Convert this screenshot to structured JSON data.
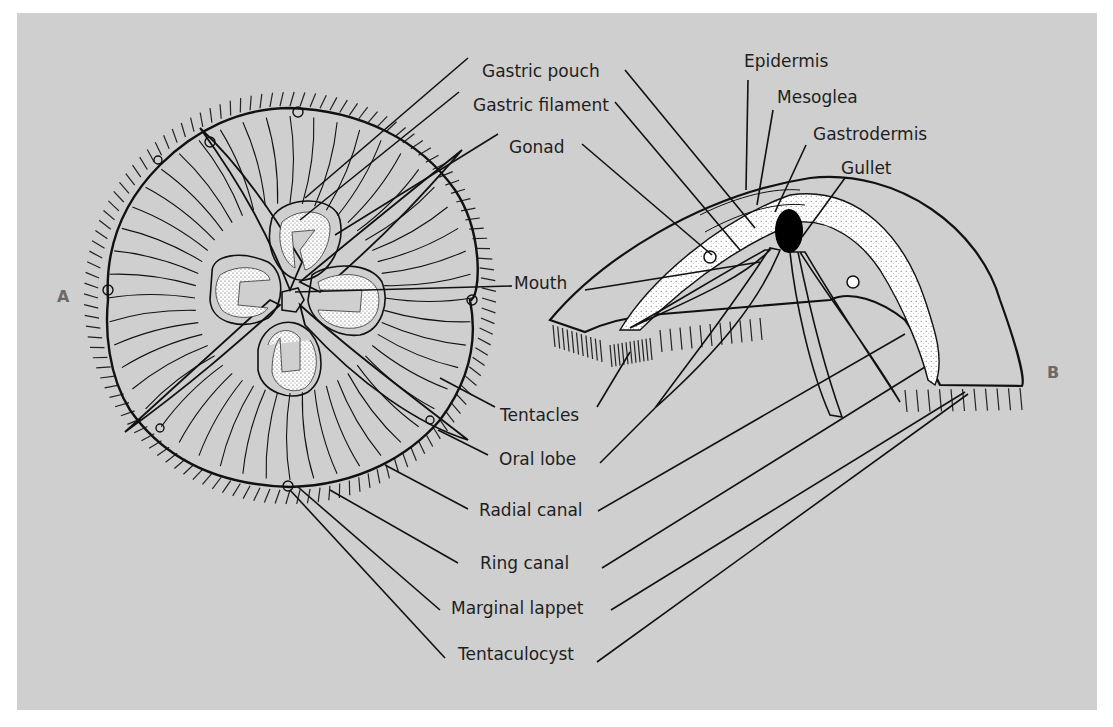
{
  "figure": {
    "panel_color": "#cfcfcf",
    "view_a_label": "A",
    "view_b_label": "B",
    "view_a_description": "Jellyfish (Aurelia) oral view",
    "view_b_description": "Jellyfish cut-away side view"
  },
  "labels": {
    "gastric_pouch": "Gastric pouch",
    "gastric_filament": "Gastric filament",
    "gonad": "Gonad",
    "mouth": "Mouth",
    "tentacles": "Tentacles",
    "oral_lobe": "Oral lobe",
    "radial_canal": "Radial canal",
    "ring_canal": "Ring canal",
    "marginal_lappet": "Marginal lappet",
    "tentaculocyst": "Tentaculocyst",
    "epidermis": "Epidermis",
    "mesoglea": "Mesoglea",
    "gastrodermis": "Gastrodermis",
    "gullet": "Gullet"
  }
}
